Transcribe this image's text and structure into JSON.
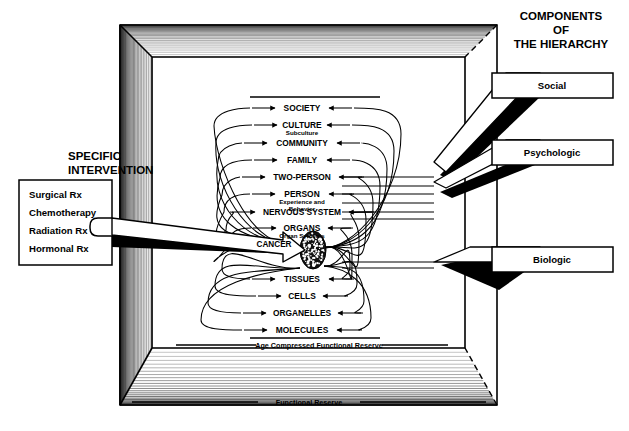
{
  "diagram": {
    "title_right": {
      "line1": "COMPONENTS",
      "line2": "OF",
      "line3": "THE HIERARCHY"
    },
    "title_left": {
      "line1": "SPECIFIC",
      "line2": "INTERVENTION"
    },
    "intervention_box": {
      "items": [
        "Surgical Rx",
        "Chemotherapy",
        "Radiation Rx",
        "Hormonal Rx"
      ]
    },
    "components": [
      {
        "label": "Social"
      },
      {
        "label": "Psychologic"
      },
      {
        "label": "Biologic"
      }
    ],
    "hierarchy_levels": [
      {
        "label": "SOCIETY",
        "sub": ""
      },
      {
        "label": "CULTURE",
        "sub": "Subculture"
      },
      {
        "label": "COMMUNITY",
        "sub": ""
      },
      {
        "label": "FAMILY",
        "sub": ""
      },
      {
        "label": "TWO-PERSON",
        "sub": ""
      },
      {
        "label": "PERSON",
        "sub": "Experience and|Behavior"
      },
      {
        "label": "NERVOUS SYSTEM",
        "sub": ""
      },
      {
        "label": "ORGANS",
        "sub": "Organ Systems"
      },
      {
        "label": "CANCER",
        "sub": ""
      },
      {
        "label": "TISSUES",
        "sub": ""
      },
      {
        "label": "CELLS",
        "sub": ""
      },
      {
        "label": "ORGANELLES",
        "sub": ""
      },
      {
        "label": "MOLECULES",
        "sub": ""
      }
    ],
    "reserve_labels": {
      "inner": "Age Compressed Functional Reserve",
      "outer": "Functional Reserve"
    },
    "colors": {
      "ink": "#000000",
      "paper": "#ffffff",
      "shade": "#555555"
    }
  }
}
